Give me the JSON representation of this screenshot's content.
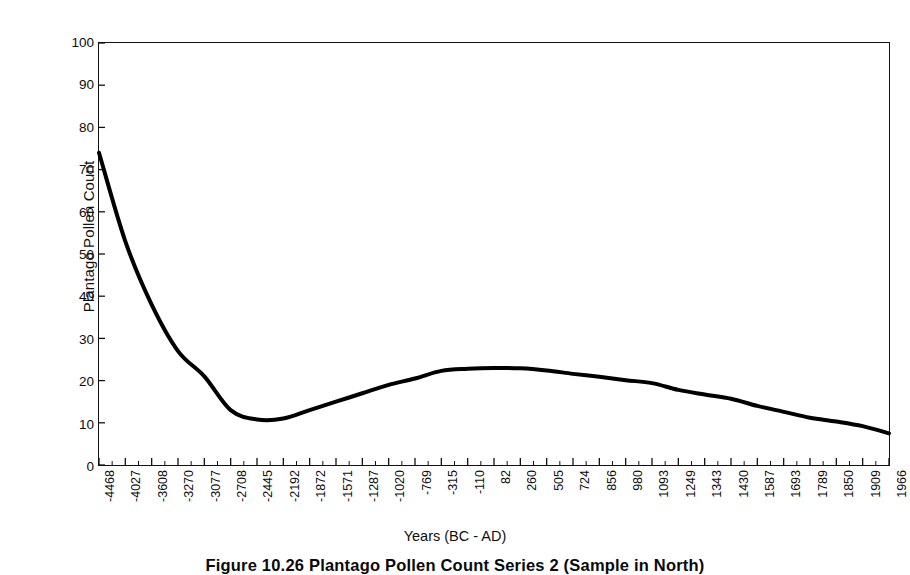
{
  "figure": {
    "caption": "Figure 10.26   Plantago Pollen Count Series 2 (Sample in North)",
    "x_axis_title": "Years (BC - AD)",
    "y_axis_title": "Plantago Pollen Count"
  },
  "chart_data": {
    "type": "line",
    "title": "",
    "xlabel": "Years (BC - AD)",
    "ylabel": "Plantago Pollen Count",
    "ylim": [
      0,
      100
    ],
    "ytick_labels": [
      "0",
      "10",
      "20",
      "30",
      "40",
      "50",
      "60",
      "70",
      "80",
      "90",
      "100"
    ],
    "ytick_values": [
      0,
      10,
      20,
      30,
      40,
      50,
      60,
      70,
      80,
      90,
      100
    ],
    "grid": false,
    "legend": "none",
    "line_color": "#000000",
    "line_width": 4,
    "categories": [
      "-4468",
      "-4027",
      "-3608",
      "-3270",
      "-3077",
      "-2708",
      "-2445",
      "-2192",
      "-1872",
      "-1571",
      "-1287",
      "-1020",
      "-769",
      "-315",
      "-110",
      "82",
      "260",
      "505",
      "724",
      "856",
      "980",
      "1093",
      "1249",
      "1343",
      "1430",
      "1587",
      "1693",
      "1789",
      "1850",
      "1909",
      "1966"
    ],
    "values": [
      74,
      53,
      38,
      27,
      21,
      13,
      10.8,
      11,
      13,
      15,
      17,
      19,
      20.5,
      22.3,
      22.8,
      23,
      22.9,
      22.4,
      21.6,
      20.9,
      20.1,
      19.4,
      17.8,
      16.7,
      15.7,
      14.0,
      12.6,
      11.2,
      10.3,
      9.2,
      7.5
    ]
  }
}
